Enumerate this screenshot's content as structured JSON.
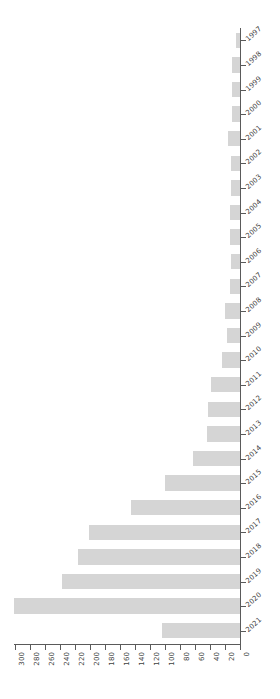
{
  "chart_data": {
    "type": "bar",
    "orientation": "horizontal",
    "title": "",
    "subtitle": "",
    "xlabel": "",
    "ylabel": "",
    "grid": false,
    "legend": null,
    "x_axis_reversed": true,
    "categories": [
      "1997",
      "1998",
      "1999",
      "2000",
      "2001",
      "2002",
      "2003",
      "2004",
      "2005",
      "2006",
      "2007",
      "2008",
      "2009",
      "2010",
      "2011",
      "2012",
      "2013",
      "2014",
      "2015",
      "2016",
      "2017",
      "2018",
      "2019",
      "2020",
      "2021"
    ],
    "values": [
      5,
      11,
      11,
      11,
      16,
      12,
      12,
      13,
      13,
      12,
      13,
      20,
      17,
      24,
      39,
      43,
      44,
      63,
      100,
      145,
      201,
      216,
      237,
      302,
      104
    ],
    "xlim": [
      0,
      300
    ],
    "xticks": [
      300,
      280,
      260,
      240,
      220,
      200,
      180,
      160,
      140,
      120,
      100,
      80,
      60,
      40,
      20,
      0
    ],
    "xtick_labels": [
      "300",
      "280",
      "260",
      "240",
      "220",
      "200",
      "180",
      "160",
      "140",
      "120",
      "100",
      "80",
      "60",
      "40",
      "20",
      "0"
    ],
    "bar_color": "#d5d5d5",
    "axis_color": "#5a5a5a",
    "label_color": "#404040",
    "background_color": "#ffffff"
  }
}
